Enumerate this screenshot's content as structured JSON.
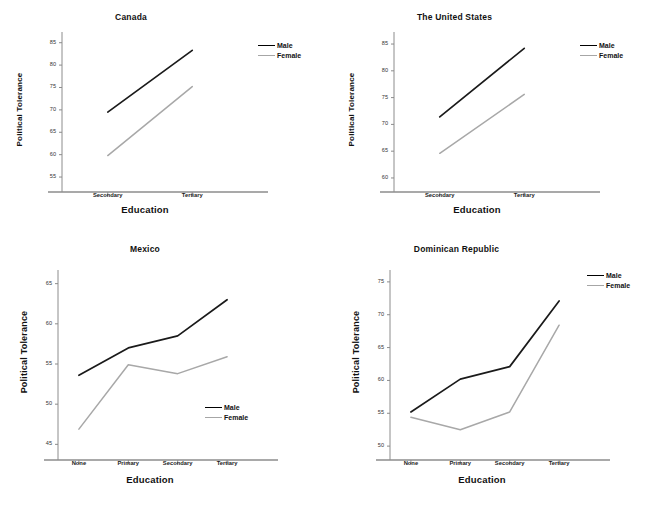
{
  "figure": {
    "series_names": [
      "Male",
      "Female"
    ],
    "colors": {
      "male": "#1a1a1a",
      "female": "#a8a8a8",
      "axis": "#8c8c8c",
      "text": "#111111"
    },
    "shared_xlabel": "Education",
    "shared_ylabel": "Political Tolerance"
  },
  "chart_data": [
    {
      "type": "line",
      "title": "Canada",
      "xlabel": "Education",
      "ylabel": "Political Tolerance",
      "categories": [
        "Secondary",
        "Tertiary"
      ],
      "ylim": [
        53,
        86.5
      ],
      "yticks": [
        55,
        60,
        65,
        70,
        75,
        80,
        85
      ],
      "ytick_labels": [
        "55",
        "60",
        "65",
        "70",
        "75",
        "80",
        "85"
      ],
      "grid": false,
      "legend": "right-outside",
      "series": [
        {
          "name": "Male",
          "values": [
            69.5,
            83.3
          ]
        },
        {
          "name": "Female",
          "values": [
            59.8,
            75.2
          ]
        }
      ]
    },
    {
      "type": "line",
      "title": "The United States",
      "xlabel": "Education",
      "ylabel": "Political Tolerance",
      "categories": [
        "Secondary",
        "Tertiary"
      ],
      "ylim": [
        58.5,
        86.5
      ],
      "yticks": [
        60,
        65,
        70,
        75,
        80,
        85
      ],
      "ytick_labels": [
        "60",
        "65",
        "70",
        "75",
        "80",
        "85"
      ],
      "grid": false,
      "legend": "right-outside",
      "series": [
        {
          "name": "Male",
          "values": [
            71.4,
            84.2
          ]
        },
        {
          "name": "Female",
          "values": [
            64.6,
            75.6
          ]
        }
      ]
    },
    {
      "type": "line",
      "title": "Mexico",
      "xlabel": "Education",
      "ylabel": "Political Tolerance",
      "categories": [
        "None",
        "Primary",
        "Secondary",
        "Tertiary"
      ],
      "ylim": [
        43.8,
        66.2
      ],
      "yticks": [
        45,
        50,
        55,
        60,
        65
      ],
      "ytick_labels": [
        "45",
        "50",
        "55",
        "60",
        "65"
      ],
      "grid": false,
      "legend": "inside-bottom-right",
      "series": [
        {
          "name": "Male",
          "values": [
            53.6,
            57.0,
            58.5,
            63.0
          ]
        },
        {
          "name": "Female",
          "values": [
            46.9,
            54.9,
            53.8,
            55.9
          ]
        }
      ]
    },
    {
      "type": "line",
      "title": "Dominican Republic",
      "xlabel": "Education",
      "ylabel": "Political Tolerance",
      "categories": [
        "None",
        "Primary",
        "Secondary",
        "Tertiary"
      ],
      "ylim": [
        48.8,
        76.2
      ],
      "yticks": [
        50,
        55,
        60,
        65,
        70,
        75
      ],
      "ytick_labels": [
        "50",
        "55",
        "60",
        "65",
        "70",
        "75"
      ],
      "grid": false,
      "legend": "right-outside",
      "series": [
        {
          "name": "Male",
          "values": [
            55.2,
            60.2,
            62.1,
            72.1
          ]
        },
        {
          "name": "Female",
          "values": [
            54.4,
            52.5,
            55.2,
            68.4
          ]
        }
      ]
    }
  ]
}
